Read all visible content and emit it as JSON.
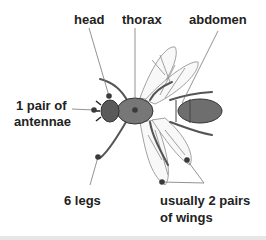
{
  "diagram": {
    "labels": {
      "head": "head",
      "thorax": "thorax",
      "abdomen": "abdomen",
      "antennae_line1": "1 pair of",
      "antennae_line2": "antennae",
      "legs": "6 legs",
      "wings_line1": "usually 2 pairs",
      "wings_line2": "of wings"
    },
    "colors": {
      "text": "#222222",
      "body_fill": "#6e6e6e",
      "body_dark": "#4a4a4a",
      "wing_stroke": "#8a8a8a",
      "leader_line": "#777777",
      "marker": "#3a3a3a"
    }
  }
}
